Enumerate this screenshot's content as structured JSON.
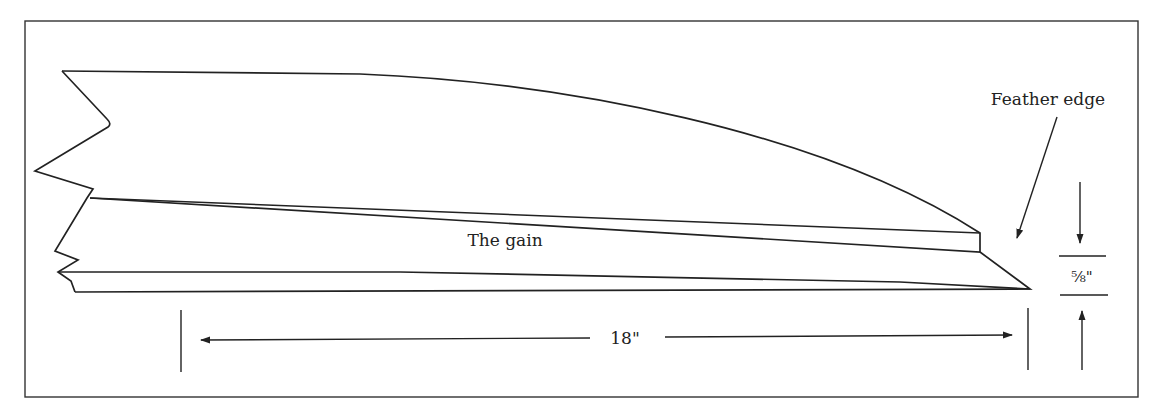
{
  "diagram": {
    "type": "technical-drawing",
    "labels": {
      "feather_edge": "Feather edge",
      "the_gain": "The gain",
      "length": "18\"",
      "thickness": "⅝\""
    },
    "dimensions": {
      "length_in_inches": 18,
      "thickness_in_inches": "5/8"
    },
    "colors": {
      "stroke": "#222222",
      "background": "#ffffff"
    }
  }
}
